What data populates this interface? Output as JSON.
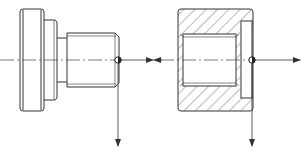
{
  "figure": {
    "colors": {
      "line": "#333333",
      "hatch": "#555555",
      "background": "#ffffff"
    },
    "parts": [
      {
        "name": "bolt",
        "view": "side view",
        "reference_point": [
          118,
          60
        ]
      },
      {
        "name": "nut",
        "view": "section view",
        "reference_point": [
          252,
          60
        ]
      }
    ],
    "arrows": [
      {
        "from": [
          118,
          60
        ],
        "to": [
          153,
          60
        ],
        "direction": "right"
      },
      {
        "from": [
          118,
          60
        ],
        "to": [
          118,
          146
        ],
        "direction": "down"
      },
      {
        "from": [
          252,
          60
        ],
        "to": [
          300,
          60
        ],
        "direction": "right"
      },
      {
        "from": [
          252,
          60
        ],
        "to": [
          252,
          146
        ],
        "direction": "down"
      }
    ]
  }
}
